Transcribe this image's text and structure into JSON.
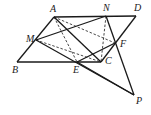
{
  "diagram": {
    "type": "geometry-figure",
    "points": {
      "A": {
        "x": 54,
        "y": 17,
        "label": "A",
        "lx": 50,
        "ly": 12
      },
      "N": {
        "x": 106,
        "y": 16,
        "label": "N",
        "lx": 103,
        "ly": 11
      },
      "D": {
        "x": 136,
        "y": 16,
        "label": "D",
        "lx": 134,
        "ly": 11
      },
      "M": {
        "x": 36,
        "y": 40,
        "label": "M",
        "lx": 26,
        "ly": 42
      },
      "F": {
        "x": 115,
        "y": 43,
        "label": "F",
        "lx": 120,
        "ly": 47
      },
      "B": {
        "x": 17,
        "y": 62,
        "label": "B",
        "lx": 12,
        "ly": 73
      },
      "E": {
        "x": 77,
        "y": 62,
        "label": "E",
        "lx": 73,
        "ly": 73
      },
      "C": {
        "x": 101,
        "y": 62,
        "label": "C",
        "lx": 105,
        "ly": 64
      },
      "P": {
        "x": 134,
        "y": 95,
        "label": "P",
        "lx": 136,
        "ly": 104
      }
    },
    "solid_segments": [
      [
        "A",
        "D"
      ],
      [
        "A",
        "B"
      ],
      [
        "B",
        "C"
      ],
      [
        "D",
        "C"
      ],
      [
        "M",
        "N"
      ],
      [
        "M",
        "P"
      ],
      [
        "N",
        "P"
      ],
      [
        "E",
        "F"
      ],
      [
        "E",
        "P"
      ],
      [
        "A",
        "C"
      ]
    ],
    "dashed_segments": [
      [
        "A",
        "E"
      ],
      [
        "A",
        "F"
      ],
      [
        "M",
        "C"
      ],
      [
        "N",
        "C"
      ]
    ]
  }
}
